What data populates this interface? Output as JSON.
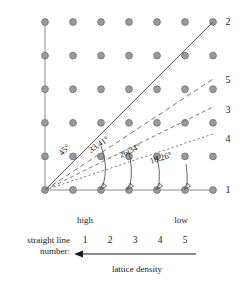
{
  "figure": {
    "title": "",
    "lattice": {
      "cols": 7,
      "rows": 6,
      "dot_color": "#9a9a9a",
      "dot_outline": "#6e6e6e"
    },
    "line_labels": [
      {
        "id": "line-2",
        "text": "2",
        "x": 228,
        "y": 25
      },
      {
        "id": "line-5",
        "text": "5",
        "x": 228,
        "y": 83
      },
      {
        "id": "line-3",
        "text": "3",
        "x": 228,
        "y": 113
      },
      {
        "id": "line-4",
        "text": "4",
        "x": 228,
        "y": 142
      },
      {
        "id": "line-1",
        "text": "1",
        "x": 228,
        "y": 193
      }
    ],
    "angle_labels": [
      {
        "id": "angle-45",
        "text": "45°",
        "x": 62,
        "y": 156,
        "rotate": -45
      },
      {
        "id": "angle-33-41",
        "text": "33.41°",
        "x": 92,
        "y": 152,
        "rotate": -34
      },
      {
        "id": "angle-26-34",
        "text": "26.34°",
        "x": 122,
        "y": 157,
        "rotate": -26
      },
      {
        "id": "angle-18-26",
        "text": "18.26°",
        "x": 152,
        "y": 163,
        "rotate": -18
      }
    ]
  },
  "legend": {
    "high_label": "high",
    "low_label": "low",
    "row_title_line1": "straight line",
    "row_title_line2": "number:",
    "numbers": [
      "1",
      "2",
      "3",
      "4",
      "5"
    ],
    "density_label": "lattice density"
  }
}
